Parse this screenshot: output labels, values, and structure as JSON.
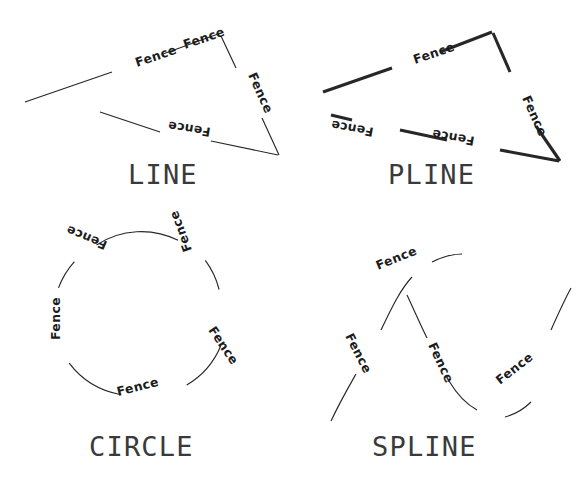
{
  "page": {
    "background_color": "#ffffff",
    "ink_color": "#272727",
    "caption_color": "#3a3a3a",
    "width": 586,
    "height": 484
  },
  "label_text": "Fence",
  "panels": [
    {
      "id": "line",
      "caption": "LINE",
      "caption_x": 128,
      "caption_y": 184,
      "stroke_weight": "thin",
      "segments": [
        {
          "d": "M 25 102 L 112 72"
        },
        {
          "d": "M 163 54 L 218 34"
        },
        {
          "d": "M 221 36 L 236 68"
        },
        {
          "d": "M 262 118 L 279 155"
        },
        {
          "d": "M 278 155 L 211 141"
        },
        {
          "d": "M 160 132 L 100 112"
        }
      ],
      "labels": [
        {
          "text": "Fence",
          "x": 137,
          "y": 67,
          "rotate": -19
        },
        {
          "text": "Fence",
          "x": 185,
          "y": 49,
          "rotate": -19
        },
        {
          "text": "Fence",
          "x": 248,
          "y": 75,
          "rotate": 66
        },
        {
          "text": "Fence",
          "x": 211,
          "y": 128,
          "rotate": 189
        }
      ]
    },
    {
      "id": "pline",
      "caption": "PLINE",
      "caption_x": 388,
      "caption_y": 184,
      "stroke_weight": "thick",
      "segments": [
        {
          "d": "M 323 92 L 392 68"
        },
        {
          "d": "M 440 52 L 492 32"
        },
        {
          "d": "M 493 33 L 510 72"
        },
        {
          "d": "M 536 126 L 560 161"
        },
        {
          "d": "M 559 161 L 500 150"
        },
        {
          "d": "M 447 140 L 400 130"
        },
        {
          "d": "M 352 120 L 331 115"
        }
      ],
      "labels": [
        {
          "text": "Fence",
          "x": 415,
          "y": 64,
          "rotate": -19
        },
        {
          "text": "Fence",
          "x": 522,
          "y": 98,
          "rotate": 66
        },
        {
          "text": "Fence",
          "x": 475,
          "y": 137,
          "rotate": 190
        },
        {
          "text": "Fence",
          "x": 374,
          "y": 128,
          "rotate": 190
        }
      ]
    },
    {
      "id": "circle",
      "caption": "CIRCLE",
      "caption_x": 89,
      "caption_y": 456,
      "stroke_weight": "thin",
      "center_x": 140,
      "center_y": 315,
      "radius": 82,
      "segments": [
        {
          "d": "M 96.5 244.9 A 82 82 0 0 1 178.1 240.3"
        },
        {
          "d": "M 205.3 260.4 A 82 82 0 0 1 219.1 289.5"
        },
        {
          "d": "M 220.8 345.8 A 82 82 0 0 1 186.7 385.1"
        },
        {
          "d": "M 120.2 394.5 A 82 82 0 0 1 69.2 363.2"
        },
        {
          "d": "M 58.5 287.9 A 82 82 0 0 1 74.4 261.6"
        }
      ],
      "labels": [
        {
          "text": "Fence",
          "x": 108,
          "y": 242,
          "rotate": 203
        },
        {
          "text": "Fence",
          "x": 192,
          "y": 250,
          "rotate": 250
        },
        {
          "text": "Fence",
          "x": 208,
          "y": 330,
          "rotate": 56
        },
        {
          "text": "Fence",
          "x": 118,
          "y": 396,
          "rotate": -14
        },
        {
          "text": "Fence",
          "x": 60,
          "y": 340,
          "rotate": -90
        }
      ]
    },
    {
      "id": "spline",
      "caption": "SPLINE",
      "caption_x": 372,
      "caption_y": 456,
      "stroke_weight": "thin",
      "segments": [
        {
          "d": "M 331 421 C 341 400 348 388 356 374"
        },
        {
          "d": "M 381 330 C 392 307 400 290 412 277"
        },
        {
          "d": "M 432 262 C 444 256 452 254 462 254"
        },
        {
          "d": "M 407 295 C 415 312 420 324 427 338"
        },
        {
          "d": "M 449 381 C 458 396 466 404 477 410"
        },
        {
          "d": "M 505 417 C 516 414 524 409 531 402"
        },
        {
          "d": "M 551 330 C 559 312 565 299 571 288"
        }
      ],
      "labels": [
        {
          "text": "Fence",
          "x": 378,
          "y": 270,
          "rotate": -22
        },
        {
          "text": "Fence",
          "x": 345,
          "y": 336,
          "rotate": 63
        },
        {
          "text": "Fence",
          "x": 428,
          "y": 345,
          "rotate": 65
        },
        {
          "text": "Fence",
          "x": 500,
          "y": 385,
          "rotate": -38
        }
      ]
    }
  ]
}
